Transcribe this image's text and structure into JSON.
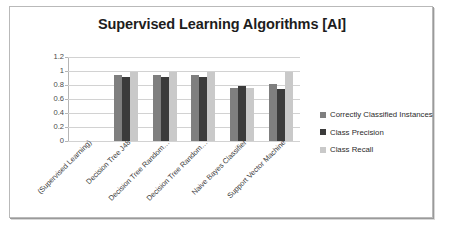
{
  "chart_data": {
    "type": "bar",
    "title": "Supervised Learning Algorithms [AI]",
    "xlabel": "",
    "ylabel": "",
    "ylim": [
      0,
      1.2
    ],
    "ytick_labels": [
      "1.2",
      "1",
      "0.8",
      "0.6",
      "0.4",
      "0.2",
      "0"
    ],
    "ytick_values": [
      1.2,
      1,
      0.8,
      0.6,
      0.4,
      0.2,
      0
    ],
    "grid": true,
    "legend_position": "right",
    "categories": [
      "(Supervised Learning)",
      "Decision Tree J48",
      "Decision Tree Random…",
      "Decision Tree Random…",
      "Naive Bayes Classifier",
      "Support Vector Machine"
    ],
    "series": [
      {
        "name": "Correctly Classified Instances",
        "color": "#7f7f7f",
        "values": [
          0,
          0.94,
          0.94,
          0.94,
          0.76,
          0.81
        ]
      },
      {
        "name": "Class Precision",
        "color": "#3b3b3b",
        "values": [
          0,
          0.92,
          0.91,
          0.92,
          0.785,
          0.74
        ]
      },
      {
        "name": "Class Recall",
        "color": "#c9c9c9",
        "values": [
          0,
          0.99,
          0.99,
          0.99,
          0.76,
          0.99
        ]
      }
    ]
  }
}
